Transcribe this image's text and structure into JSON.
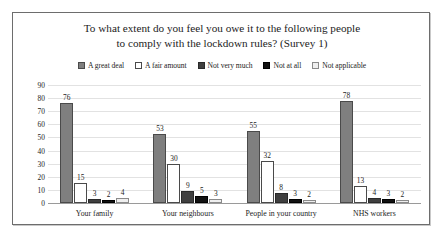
{
  "chart_data": {
    "type": "bar",
    "title": "To what extent do you feel you owe it to the following people to comply with the lockdown rules? (Survey 1)",
    "title_lines": [
      "To what extent do you feel you owe it to the following people",
      "to comply with the lockdown rules? (Survey 1)"
    ],
    "xlabel": "",
    "ylabel": "",
    "ylim": [
      0,
      90
    ],
    "y_ticks": [
      90,
      80,
      70,
      60,
      50,
      40,
      30,
      20,
      10,
      0
    ],
    "grid": true,
    "legend_position": "top-center",
    "categories": [
      "Your family",
      "Your neighbours",
      "People in your country",
      "NHS workers"
    ],
    "series": [
      {
        "name": "A great deal",
        "color": "#7f7f7f",
        "border": "#4a4a4a",
        "values": [
          76,
          53,
          55,
          78
        ]
      },
      {
        "name": "A fair amount",
        "color": "#ffffff",
        "border": "#4a4a4a",
        "values": [
          15,
          30,
          32,
          13
        ]
      },
      {
        "name": "Not very much",
        "color": "#3f3f3f",
        "border": "#2a2a2a",
        "values": [
          3,
          9,
          8,
          4
        ]
      },
      {
        "name": "Not at all",
        "color": "#111111",
        "border": "#000000",
        "values": [
          2,
          5,
          3,
          3
        ]
      },
      {
        "name": "Not applicable",
        "color": "#efefef",
        "border": "#8a8a8a",
        "values": [
          4,
          3,
          2,
          2
        ]
      }
    ]
  }
}
